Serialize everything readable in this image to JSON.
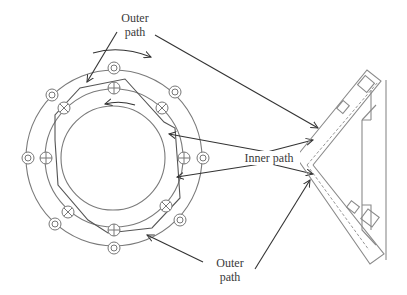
{
  "diagram": {
    "type": "flange-weld-path schematic",
    "labels": {
      "outer_path_top": [
        "Outer",
        "path"
      ],
      "inner_path": "Inner path",
      "outer_path_bottom": [
        "Outer",
        "path"
      ]
    },
    "rings": {
      "center": [
        114,
        158
      ],
      "outer_radius": 88,
      "middle_radius": 69,
      "inner_radius": 52
    },
    "outer_bolt_symbols": {
      "glyph": "double-circle",
      "positions": [
        [
          114,
          68
        ],
        [
          52,
          95
        ],
        [
          175,
          92
        ],
        [
          28,
          158
        ],
        [
          203,
          158
        ],
        [
          55,
          224
        ],
        [
          180,
          220
        ],
        [
          114,
          248
        ]
      ]
    },
    "inner_bolt_symbols": {
      "positions": [
        {
          "xy": [
            114,
            88
          ],
          "glyph": "circle-plus"
        },
        {
          "xy": [
            64,
            108
          ],
          "glyph": "circle-cross"
        },
        {
          "xy": [
            162,
            108
          ],
          "glyph": "circle-cross"
        },
        {
          "xy": [
            46,
            158
          ],
          "glyph": "circle-plus"
        },
        {
          "xy": [
            184,
            158
          ],
          "glyph": "circle-plus"
        },
        {
          "xy": [
            68,
            212
          ],
          "glyph": "circle-cross"
        },
        {
          "xy": [
            166,
            206
          ],
          "glyph": "circle-cross"
        },
        {
          "xy": [
            114,
            230
          ],
          "glyph": "circle-plus"
        }
      ]
    },
    "rotation_arrows": [
      {
        "direction": "clockwise",
        "location": "above outer ring"
      },
      {
        "direction": "counterclockwise",
        "location": "inside inner ring top"
      }
    ]
  }
}
